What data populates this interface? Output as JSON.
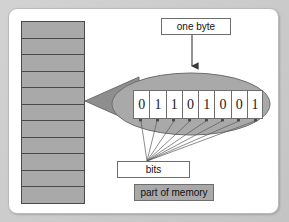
{
  "figure": {
    "background_color": "#c9c9c9",
    "card_color": "#ffffff",
    "fill_gray": "#a9a9a9",
    "stroke_gray": "#6e6e6e",
    "stroke_dark": "#4a4a4a"
  },
  "memory_column": {
    "name": "part of memory",
    "cell_count": 11,
    "cells": [
      {
        "index": 0
      },
      {
        "index": 1
      },
      {
        "index": 2
      },
      {
        "index": 3
      },
      {
        "index": 4
      },
      {
        "index": 5
      },
      {
        "index": 6
      },
      {
        "index": 7
      },
      {
        "index": 8
      },
      {
        "index": 9
      },
      {
        "index": 10
      }
    ]
  },
  "magnifier": {
    "description": "cone expanding from memory cell into ellipse",
    "ellipse_fill": "#a9a9a9"
  },
  "byte": {
    "bits": [
      "0",
      "1",
      "1",
      "0",
      "1",
      "0",
      "0",
      "1"
    ],
    "bit_count": 8,
    "value_string": "01101001"
  },
  "labels": {
    "one_byte": "one byte",
    "bits": "bits",
    "part_of_memory": "part of memory"
  }
}
